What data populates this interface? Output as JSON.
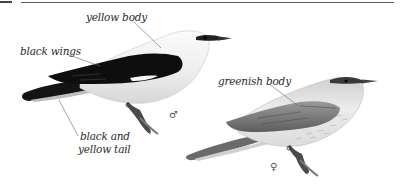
{
  "illustration": {
    "male": {
      "sex_symbol": "♂",
      "labels": {
        "body": "yellow body",
        "wings": "black wings",
        "tail_line1": "black and",
        "tail_line2": "yellow tail"
      }
    },
    "female": {
      "sex_symbol": "♀",
      "labels": {
        "body": "greenish body"
      }
    }
  },
  "colors": {
    "rule": "#5a5a5a",
    "label_text": "#2b2b2b",
    "leader_line": "#6a6a6a",
    "male_wing": "#111111",
    "male_body": "#f2f2f2",
    "female_body": "#e6e6e6",
    "female_wing": "#8a8a8a"
  }
}
